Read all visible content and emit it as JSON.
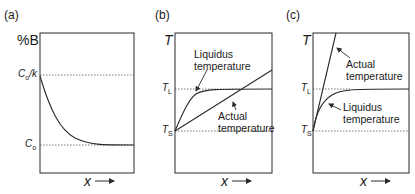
{
  "panels": [
    {
      "id": "a",
      "label": "(a)",
      "y_axis_label": "%B",
      "x_axis_label": "x",
      "levels": [
        {
          "name": "C0/k",
          "label_main": "C",
          "label_sub": "o",
          "label_suffix": "/k"
        },
        {
          "name": "C0",
          "label_main": "C",
          "label_sub": "o"
        }
      ],
      "curves": [
        {
          "name": "solute-concentration",
          "shape": "exponential decay from C0/k to C0"
        }
      ]
    },
    {
      "id": "b",
      "label": "(b)",
      "y_axis_label": "T",
      "x_axis_label": "x",
      "levels": [
        {
          "name": "TL",
          "label_main": "T",
          "label_sub": "L"
        },
        {
          "name": "TS",
          "label_main": "T",
          "label_sub": "S"
        }
      ],
      "annotations": [
        {
          "name": "liquidus",
          "lines": [
            "Liquidus",
            "temperature"
          ]
        },
        {
          "name": "actual",
          "lines": [
            "Actual",
            "temperature"
          ]
        }
      ]
    },
    {
      "id": "c",
      "label": "(c)",
      "y_axis_label": "T",
      "x_axis_label": "x",
      "levels": [
        {
          "name": "TL",
          "label_main": "T",
          "label_sub": "L"
        },
        {
          "name": "TS",
          "label_main": "T",
          "label_sub": "S"
        }
      ],
      "annotations": [
        {
          "name": "actual",
          "lines": [
            "Actual",
            "temperature"
          ]
        },
        {
          "name": "liquidus",
          "lines": [
            "Liquidus",
            "temperature"
          ]
        }
      ]
    }
  ],
  "colors": {
    "line": "#2a2a2a",
    "dotted": "#555555",
    "background": "#ffffff"
  }
}
